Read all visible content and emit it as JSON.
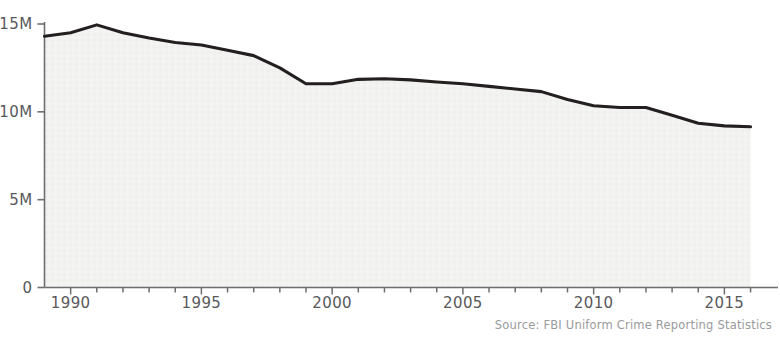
{
  "source_note": "Source: FBI Uniform Crime Reporting Statistics",
  "axis": {
    "y_ticks": [
      "0",
      "5M",
      "10M",
      "15M"
    ],
    "x_ticks": [
      "1990",
      "1995",
      "2000",
      "2005",
      "2010",
      "2015"
    ]
  },
  "colors": {
    "line": "#231f20",
    "fill": "#f2f2f1",
    "axis": "#6d6e70",
    "tick_text": "#58585a",
    "source_text": "#9a9a9c",
    "background": "#ffffff"
  },
  "chart_data": {
    "type": "area",
    "title": "",
    "subtitle": "",
    "xlabel": "",
    "ylabel": "",
    "xlim": [
      1989,
      2016
    ],
    "ylim": [
      0,
      15900000
    ],
    "grid": false,
    "legend": null,
    "y_tick_values": [
      0,
      5000000,
      10000000,
      15000000
    ],
    "y_tick_labels": [
      "0",
      "5M",
      "10M",
      "15M"
    ],
    "x_tick_values": [
      1990,
      1995,
      2000,
      2005,
      2010,
      2015
    ],
    "x_tick_labels": [
      "1990",
      "1995",
      "2000",
      "2005",
      "2010",
      "2015"
    ],
    "x_minor_tick_step": 1,
    "source": "Source: FBI Uniform Crime Reporting Statistics",
    "series": [
      {
        "name": "Total reported crimes",
        "x": [
          1989,
          1990,
          1991,
          1992,
          1993,
          1994,
          1995,
          1996,
          1997,
          1998,
          1999,
          2000,
          2001,
          2002,
          2003,
          2004,
          2005,
          2006,
          2007,
          2008,
          2009,
          2010,
          2011,
          2012,
          2013,
          2014,
          2015,
          2016
        ],
        "values": [
          14300000,
          14500000,
          14950000,
          14500000,
          14200000,
          13950000,
          13800000,
          13500000,
          13200000,
          12500000,
          11600000,
          11600000,
          11850000,
          11880000,
          11820000,
          11700000,
          11600000,
          11450000,
          11300000,
          11150000,
          10700000,
          10350000,
          10250000,
          10250000,
          9800000,
          9350000,
          9200000,
          9150000
        ]
      }
    ]
  }
}
